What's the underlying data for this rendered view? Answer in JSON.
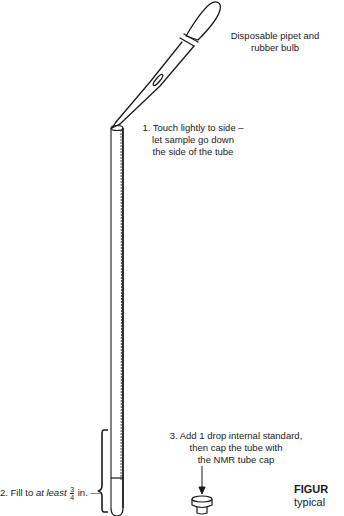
{
  "labels": {
    "pipet": [
      "Disposable pipet and",
      "rubber bulb"
    ],
    "step1": [
      "1. Touch lightly to side –",
      "let sample go down",
      "the side of the tube"
    ],
    "step2": {
      "prefix": "2. Fill to ",
      "emphasis": "at least",
      "fraction_numerator": "3",
      "fraction_denominator": "4",
      "suffix": " in."
    },
    "step3": [
      "3. Add 1 drop internal standard,",
      "then cap the tube with",
      "the NMR tube cap"
    ]
  },
  "caption": {
    "figure_label": "FIGUR",
    "text": "typical"
  },
  "parts": {
    "pipet": "disposable-pipet-with-rubber-bulb",
    "tube": "nmr-tube",
    "cap": "nmr-tube-cap",
    "fill_bracket": "fill-level-brace",
    "arrow": "down-arrow"
  }
}
